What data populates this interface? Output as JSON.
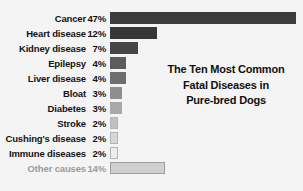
{
  "chart_data": {
    "type": "bar",
    "orientation": "horizontal",
    "title": "The Ten Most Common Fatal Diseases in Pure-bred Dogs",
    "title_lines": [
      "The Ten Most Common",
      "Fatal Diseases in",
      "Pure-bred Dogs"
    ],
    "xlabel": "",
    "ylabel": "",
    "xlim": [
      0,
      47
    ],
    "grid": false,
    "legend": null,
    "value_unit": "%",
    "background_color": "#f4f4f4",
    "categories": [
      "Cancer",
      "Heart disease",
      "Kidney disease",
      "Epilepsy",
      "Liver disease",
      "Bloat",
      "Diabetes",
      "Stroke",
      "Cushing's disease",
      "Immune diseases",
      "Other causes"
    ],
    "values": [
      47,
      12,
      7,
      4,
      4,
      3,
      3,
      2,
      2,
      2,
      14
    ],
    "value_labels": [
      "47%",
      "12%",
      "7%",
      "4%",
      "4%",
      "3%",
      "3%",
      "2%",
      "2%",
      "2%",
      "14%"
    ],
    "bar_colors": [
      "#3c3c3c",
      "#373737",
      "#454545",
      "#5c5c5c",
      "#6e6e6e",
      "#8e8e8e",
      "#a8a8a8",
      "#c0c0c0",
      "#d6d6d6",
      "#ececec",
      "#cfcfcf"
    ],
    "bar_border_colors": [
      "none",
      "none",
      "none",
      "none",
      "none",
      "none",
      "none",
      "#b4b4b4",
      "#b4b4b4",
      "#b4b4b4",
      "#9e9e9e"
    ],
    "label_colors": [
      "#131313",
      "#131313",
      "#131313",
      "#131313",
      "#131313",
      "#131313",
      "#131313",
      "#131313",
      "#131313",
      "#131313",
      "#9b9b9b"
    ],
    "muted_rows": [
      "Other causes"
    ]
  }
}
